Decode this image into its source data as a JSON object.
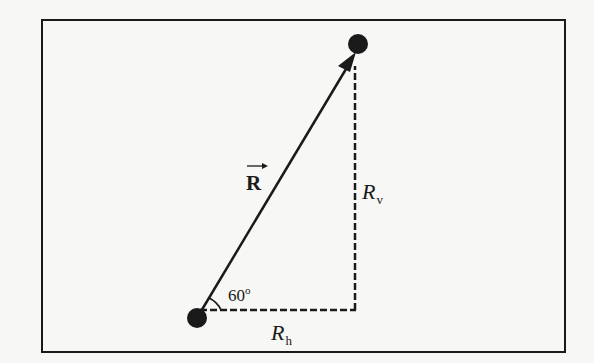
{
  "diagram": {
    "type": "vector-components",
    "colors": {
      "ink": "#1a1a1a",
      "background": "#f7f7f5"
    },
    "vector": {
      "label": "R",
      "notation": "vector-arrow",
      "bold": true
    },
    "angle": {
      "value": "60",
      "unit": "o",
      "display": "60°"
    },
    "components": {
      "vertical": {
        "base": "R",
        "subscript": "v"
      },
      "horizontal": {
        "base": "R",
        "subscript": "h"
      }
    },
    "endpoints": [
      "start-point",
      "end-point"
    ]
  }
}
